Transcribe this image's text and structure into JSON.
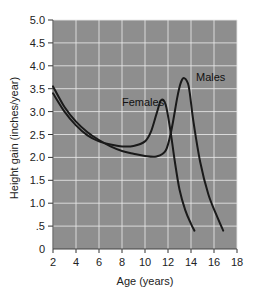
{
  "chart_data": {
    "type": "line",
    "title": "",
    "xlabel": "Age (years)",
    "ylabel": "Height gain (inches/year)",
    "xlim": [
      2,
      18
    ],
    "ylim": [
      0,
      5.0
    ],
    "x_ticks": [
      "2",
      "4",
      "6",
      "8",
      "10",
      "12",
      "14",
      "16",
      "18"
    ],
    "y_ticks": [
      "0",
      ".5",
      "1.0",
      "1.5",
      "2.0",
      "2.5",
      "3.0",
      "3.5",
      "4.0",
      "4.5",
      "5.0"
    ],
    "grid": true,
    "legend": "inline labels",
    "series": [
      {
        "name": "Females",
        "x": [
          2,
          3,
          4,
          5,
          6,
          7,
          8,
          9,
          10,
          10.5,
          11,
          11.4,
          11.8,
          12.2,
          12.6,
          13,
          13.5,
          14,
          14.3
        ],
        "y": [
          3.4,
          3.0,
          2.7,
          2.48,
          2.35,
          2.28,
          2.24,
          2.25,
          2.35,
          2.55,
          2.95,
          3.25,
          3.15,
          2.6,
          1.9,
          1.3,
          0.85,
          0.55,
          0.4
        ]
      },
      {
        "name": "Males",
        "x": [
          2,
          3,
          4,
          5,
          6,
          7,
          8,
          9,
          10,
          11,
          11.8,
          12.3,
          12.8,
          13.1,
          13.4,
          13.8,
          14.2,
          14.8,
          15.5,
          16.2,
          16.8
        ],
        "y": [
          3.55,
          3.1,
          2.78,
          2.55,
          2.38,
          2.24,
          2.14,
          2.08,
          2.03,
          2.02,
          2.15,
          2.6,
          3.3,
          3.62,
          3.73,
          3.55,
          2.8,
          1.9,
          1.2,
          0.75,
          0.4
        ]
      }
    ]
  },
  "labels": {
    "females": "Females",
    "males": "Males",
    "xlabel": "Age (years)",
    "ylabel": "Height gain (inches/year)"
  },
  "colors": {
    "plot_background": "#8e8e8e",
    "grid": "#e8e8e8",
    "line": "#1a1a1a"
  }
}
